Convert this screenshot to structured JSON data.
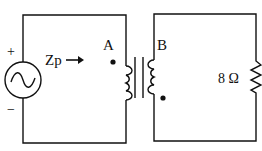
{
  "diagram": {
    "type": "transformer-circuit",
    "source": {
      "plus_label": "+",
      "minus_label": "−",
      "symbol": "ac-source"
    },
    "impedance_label": "Zp",
    "impedance_arrow": "→",
    "primary_dot_label": "A",
    "secondary_dot_label": "B",
    "load": {
      "label": "8 Ω",
      "component": "resistor"
    },
    "colors": {
      "stroke": "#111111",
      "background": "#ffffff"
    }
  }
}
